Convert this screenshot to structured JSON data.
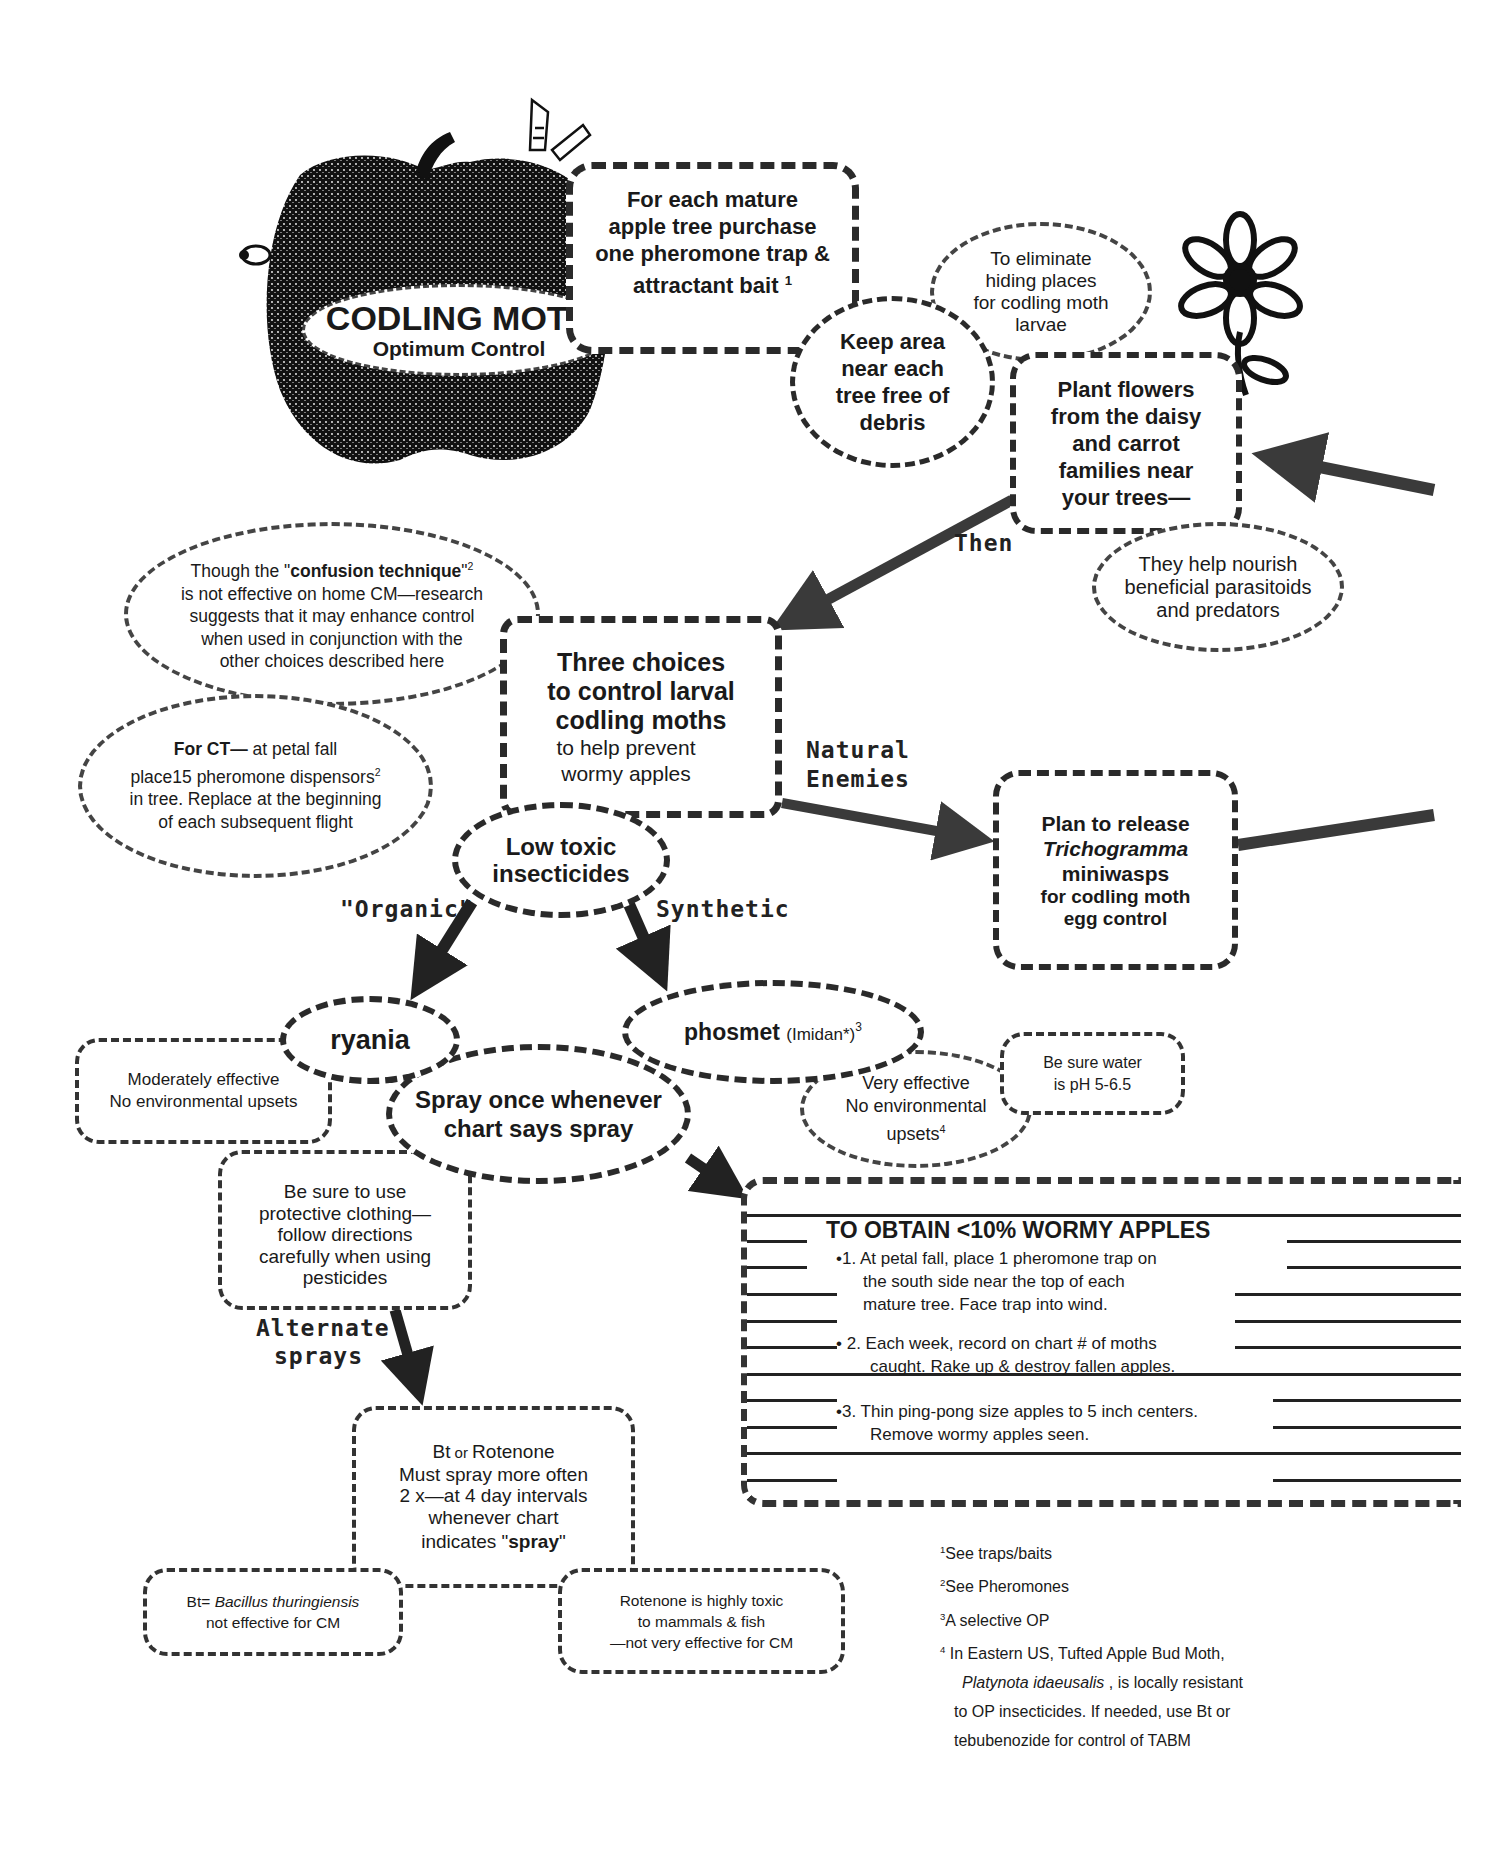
{
  "title": {
    "main": "CODLING MOTH",
    "sub": "Optimum Control"
  },
  "nodes": {
    "purchase_trap": {
      "lines": [
        "For each mature",
        "apple tree purchase",
        "one pheromone trap &",
        "attractant bait"
      ],
      "footnote_ref": "1"
    },
    "keep_area": {
      "lines": [
        "Keep area",
        "near each",
        "tree free of",
        "debris"
      ]
    },
    "eliminate_hiding": {
      "lines": [
        "To eliminate",
        "hiding places",
        "for codling moth",
        "larvae"
      ]
    },
    "plant_flowers": {
      "lines": [
        "Plant flowers",
        "from the daisy",
        "and carrot",
        "families near",
        "your trees—"
      ]
    },
    "nourish": {
      "lines": [
        "They help nourish",
        "beneficial parasitoids",
        "and predators"
      ]
    },
    "confusion": {
      "line1_prefix": "Though the \"",
      "line1_bold": "confusion  technique",
      "line1_suffix": "\"",
      "footnote_ref": "2",
      "lines": [
        "is not effective on home CM—research",
        "suggests that it may enhance control",
        "when used in conjunction with the",
        "other choices described here"
      ]
    },
    "for_ct": {
      "bold": "For CT—",
      "line1_rest": " at petal fall",
      "line2": "place15 pheromone dispensors",
      "footnote_ref": "2",
      "lines": [
        "in tree.   Replace at the beginning",
        "of each subsequent flight"
      ]
    },
    "three_choices": {
      "bold_lines": [
        "Three choices",
        "to control larval",
        "codling moths"
      ],
      "lines": [
        "to help prevent",
        "wormy apples"
      ]
    },
    "trichogramma": {
      "line1": "Plan to release",
      "italic": "Trichogramma",
      "line3": "miniwasps",
      "lines": [
        "for codling moth",
        "egg control"
      ]
    },
    "low_toxic": {
      "lines": [
        "Low toxic",
        "insecticides"
      ]
    },
    "ryania": {
      "label": "ryania"
    },
    "ryania_notes": {
      "lines": [
        "Moderately effective",
        "No environmental upsets"
      ]
    },
    "phosmet": {
      "label": "phosmet",
      "trade": "(Imidan*)",
      "footnote_ref": "3"
    },
    "spray_once": {
      "lines": [
        "Spray once whenever",
        "chart says spray"
      ]
    },
    "phosmet_notes": {
      "lines": [
        "Very effective",
        "No environmental"
      ],
      "last": "upsets",
      "footnote_ref": "4"
    },
    "water_ph": {
      "lines": [
        "Be sure water",
        "is pH 5-6.5"
      ]
    },
    "protective": {
      "lines": [
        "Be sure to use",
        "protective clothing—",
        "follow directions",
        "carefully when using",
        "pesticides"
      ]
    },
    "bt_rotenone": {
      "line1_a": "Bt",
      "line1_or": " or ",
      "line1_b": "Rotenone",
      "lines": [
        "Must spray more often",
        "2 x—at 4 day intervals",
        "whenever chart"
      ],
      "last_prefix": "indicates \"",
      "last_bold": "spray",
      "last_suffix": "\""
    },
    "bt_def": {
      "prefix": "Bt= ",
      "italic": "Bacillus thuringiensis",
      "line2": "not effective for CM"
    },
    "rotenone_note": {
      "lines": [
        "Rotenone is highly toxic",
        "to mammals & fish",
        "—not very effective for CM"
      ]
    }
  },
  "arrow_labels": {
    "then": "Then",
    "natural_1": "Natural",
    "natural_2": "Enemies",
    "organic": "\"Organic\"",
    "synthetic": "Synthetic",
    "alternate_1": "Alternate",
    "alternate_2": "sprays"
  },
  "goal_box": {
    "heading": "TO OBTAIN <10% WORMY APPLES",
    "steps": [
      {
        "bullet": "•",
        "num": "1.",
        "lines": [
          "At petal fall, place 1 pheromone trap on",
          "the south side near the top of each",
          "mature tree.  Face trap into wind."
        ]
      },
      {
        "bullet": "•",
        "num": "2.",
        "lines": [
          "Each week, record on chart # of moths",
          "caught.  Rake up & destroy fallen apples."
        ]
      },
      {
        "bullet": "•",
        "num": "3.",
        "lines": [
          "Thin ping-pong size apples to 5 inch centers.",
          "Remove wormy apples seen."
        ]
      }
    ]
  },
  "footnotes": [
    {
      "num": "1",
      "text": "See traps/baits"
    },
    {
      "num": "2",
      "text": "See Pheromones"
    },
    {
      "num": "3",
      "text": "A selective OP"
    },
    {
      "num": "4",
      "text": "In Eastern US, Tufted Apple Bud Moth,"
    }
  ],
  "footnote4_cont": {
    "italic": "Platynota idaeusalis",
    "rest": "   , is locally resistant",
    "lines": [
      "to OP insecticides.  If needed, use Bt or",
      "tebubenozide for control of TABM"
    ]
  },
  "colors": {
    "ink": "#1a1a1a",
    "arrow": "#3a3a3a",
    "background": "#ffffff"
  }
}
